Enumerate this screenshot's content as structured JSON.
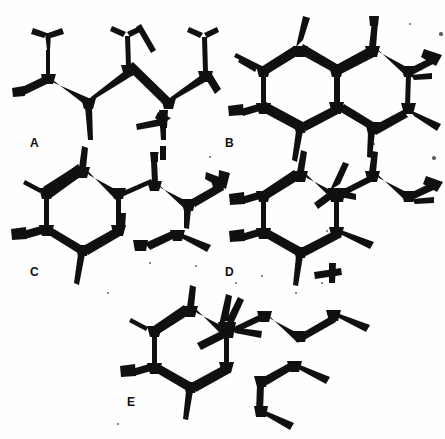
{
  "figure": {
    "caption_visible": false,
    "background_color": "#fefefe",
    "ink_color": "#101010",
    "width": 445,
    "height": 439,
    "style": "hand-inked skeletal (bond-line) chemical structures, scanned bitonal"
  },
  "panels": [
    {
      "id": "A",
      "label": "A",
      "label_x": 30,
      "label_y": 137,
      "description": "acyclic branched zig-zag carbon chain with three vertical methyl branches above and two methyl branches below"
    },
    {
      "id": "B",
      "label": "B",
      "label_x": 225,
      "label_y": 137,
      "description": "fused bicyclic six-membered ring system (decalin-like) with methyl substituents and an isopropyl branch at right"
    },
    {
      "id": "C",
      "label": "C",
      "label_x": 30,
      "label_y": 266,
      "description": "single six-membered ring bearing methyl substituents with an unsaturated side chain extending to the right"
    },
    {
      "id": "D",
      "label": "D",
      "label_x": 225,
      "label_y": 266,
      "description": "six-membered ring with quaternary centre and branched side chain extending right"
    },
    {
      "id": "E",
      "label": "E",
      "label_x": 127,
      "label_y": 396,
      "description": "six-membered ring with quaternary carbon bearing two methyls, side chain to the right and a detached fragment below right"
    }
  ],
  "specks": [
    {
      "x": 441,
      "y": 34,
      "r": 1.6
    },
    {
      "x": 410,
      "y": 24,
      "r": 1.2
    },
    {
      "x": 158,
      "y": 153,
      "r": 1.1
    },
    {
      "x": 210,
      "y": 157,
      "r": 1.4
    },
    {
      "x": 434,
      "y": 158,
      "r": 1.8
    },
    {
      "x": 150,
      "y": 263,
      "r": 1.0
    },
    {
      "x": 196,
      "y": 266,
      "r": 1.1
    },
    {
      "x": 236,
      "y": 283,
      "r": 1.0
    },
    {
      "x": 262,
      "y": 276,
      "r": 1.2
    },
    {
      "x": 322,
      "y": 283,
      "r": 1.1
    },
    {
      "x": 327,
      "y": 231,
      "r": 1.2
    },
    {
      "x": 108,
      "y": 293,
      "r": 1.0
    },
    {
      "x": 296,
      "y": 293,
      "r": 1.3
    },
    {
      "x": 374,
      "y": 144,
      "r": 1.0
    },
    {
      "x": 118,
      "y": 424,
      "r": 0.9
    }
  ]
}
